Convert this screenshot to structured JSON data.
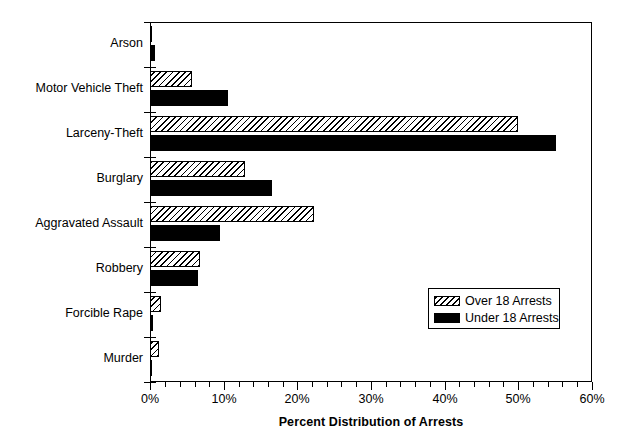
{
  "chart_data": {
    "type": "bar",
    "orientation": "horizontal",
    "title": "",
    "xlabel": "Percent Distribution of Arrests",
    "ylabel": "",
    "xlim": [
      0,
      60
    ],
    "xunit": "%",
    "grid": false,
    "legend_position": "center-right-inside",
    "xticks": [
      0,
      10,
      20,
      30,
      40,
      50,
      60
    ],
    "xtick_labels": [
      "0%",
      "10%",
      "20%",
      "30%",
      "40%",
      "50%",
      "60%"
    ],
    "xminor_tick_step": 2,
    "categories": [
      "Arson",
      "Motor Vehicle Theft",
      "Larceny-Theft",
      "Burglary",
      "Aggravated Assault",
      "Robbery",
      "Forcible Rape",
      "Murder"
    ],
    "series": [
      {
        "name": "Over 18 Arrests",
        "pattern": "diagonal-hatch",
        "color": "#ffffff",
        "values": [
          0.3,
          5.7,
          49.9,
          12.9,
          22.2,
          6.8,
          1.5,
          1.2
        ]
      },
      {
        "name": "Under 18 Arrests",
        "pattern": "solid",
        "color": "#000000",
        "values": [
          0.7,
          10.6,
          55.1,
          16.6,
          9.5,
          6.5,
          0.4,
          0.3
        ]
      }
    ]
  },
  "legend": {
    "entries": [
      {
        "label": "Over 18 Arrests",
        "swatch": "hatched-swatch"
      },
      {
        "label": "Under 18 Arrests",
        "swatch": "solid-black-swatch"
      }
    ]
  },
  "axis": {
    "x_title": "Percent Distribution of Arrests"
  },
  "colors": {
    "foreground": "#000000",
    "background": "#ffffff"
  }
}
